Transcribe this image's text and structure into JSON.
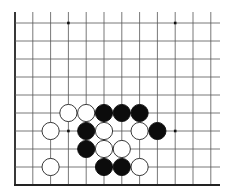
{
  "board": {
    "columns": 12,
    "rows": 10,
    "left_edge": true,
    "bottom_edge": true,
    "origin_x": 15,
    "origin_y": 23,
    "spacing_x": 17.8,
    "spacing_y": 18,
    "line_color": "#555555",
    "edge_color": "#222222",
    "star_points": [
      [
        3,
        0
      ],
      [
        9,
        0
      ],
      [
        3,
        6
      ],
      [
        9,
        6
      ]
    ],
    "stones": [
      {
        "color": "white",
        "col": 3,
        "row": 5
      },
      {
        "color": "white",
        "col": 4,
        "row": 5
      },
      {
        "color": "black",
        "col": 5,
        "row": 5
      },
      {
        "color": "black",
        "col": 6,
        "row": 5
      },
      {
        "color": "black",
        "col": 7,
        "row": 5
      },
      {
        "color": "white",
        "col": 2,
        "row": 6
      },
      {
        "color": "black",
        "col": 4,
        "row": 6
      },
      {
        "color": "white",
        "col": 5,
        "row": 6
      },
      {
        "color": "white",
        "col": 7,
        "row": 6
      },
      {
        "color": "black",
        "col": 8,
        "row": 6
      },
      {
        "color": "black",
        "col": 4,
        "row": 7
      },
      {
        "color": "white",
        "col": 5,
        "row": 7
      },
      {
        "color": "white",
        "col": 6,
        "row": 7
      },
      {
        "color": "white",
        "col": 2,
        "row": 8
      },
      {
        "color": "black",
        "col": 5,
        "row": 8
      },
      {
        "color": "black",
        "col": 6,
        "row": 8
      },
      {
        "color": "white",
        "col": 7,
        "row": 8
      }
    ]
  }
}
